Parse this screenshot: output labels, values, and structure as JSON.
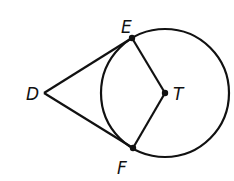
{
  "diagram": {
    "type": "geometry",
    "colors": {
      "stroke": "#111111",
      "background": "#ffffff"
    },
    "points": [
      {
        "id": "D",
        "label": "D",
        "x": 44,
        "y": 93
      },
      {
        "id": "E",
        "label": "E",
        "x": 132,
        "y": 38
      },
      {
        "id": "F",
        "label": "F",
        "x": 133,
        "y": 148
      },
      {
        "id": "T",
        "label": "T",
        "x": 165,
        "y": 93
      }
    ],
    "circle": {
      "center": "T",
      "cx": 165,
      "cy": 93,
      "r": 64
    },
    "segments": [
      {
        "from": "D",
        "to": "E"
      },
      {
        "from": "D",
        "to": "F"
      },
      {
        "from": "E",
        "to": "T"
      },
      {
        "from": "F",
        "to": "T"
      }
    ],
    "labels": {
      "D": "D",
      "E": "E",
      "F": "F",
      "T": "T"
    }
  }
}
